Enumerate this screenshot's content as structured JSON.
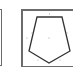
{
  "palette": {
    "tiles": [
      {
        "id": "previous-shape-tile",
        "partial": true
      },
      {
        "id": "pentagon-shape-tile",
        "icon": "pentagon-icon",
        "stroke_color": "#333333",
        "handle_color": "#9a9a9a",
        "border_color": "#6b6b6b"
      }
    ]
  }
}
